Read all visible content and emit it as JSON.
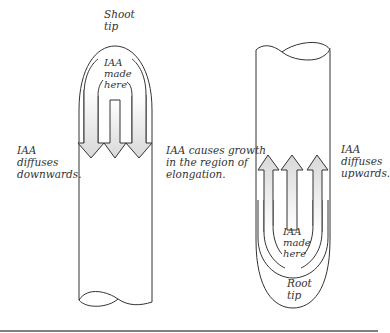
{
  "figure": {
    "shoot": {
      "tip_label": [
        "Shoot",
        "tip"
      ],
      "source_label": [
        "IAA",
        "made",
        "here"
      ],
      "diffusion_label": [
        "IAA",
        "diffuses",
        "downwards."
      ],
      "growth_label": [
        "IAA causes growth",
        "in the region of",
        "elongation."
      ],
      "arrow_direction": "down",
      "arrow_count": 3
    },
    "root": {
      "tip_label": [
        "Root",
        "tip"
      ],
      "source_label": [
        "IAA",
        "made",
        "here"
      ],
      "diffusion_label": [
        "IAA",
        "diffuses",
        "upwards."
      ],
      "arrow_direction": "up",
      "arrow_count": 3
    },
    "colors": {
      "outline": "#333333",
      "arrow_fill": "#e4e4e4",
      "text": "#333333",
      "bottom_rule": "#555555"
    }
  }
}
